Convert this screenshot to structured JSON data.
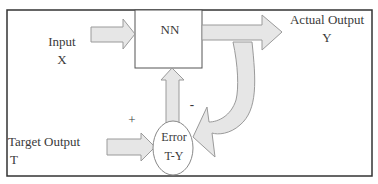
{
  "diagram": {
    "nodes": {
      "nn": {
        "label": "NN"
      },
      "error": {
        "line1": "Error",
        "line2": "T-Y"
      }
    },
    "labels": {
      "input": {
        "line1": "Input",
        "line2": "X"
      },
      "actual_output": {
        "line1": "Actual Output",
        "line2": "Y"
      },
      "target_output": {
        "line1": "Target Output",
        "line2": "T"
      },
      "plus_sign": "+",
      "minus_sign": "-"
    },
    "edges": [
      {
        "from": "input",
        "to": "nn"
      },
      {
        "from": "nn",
        "to": "actual_output"
      },
      {
        "from": "actual_output",
        "to": "error",
        "sign": "-"
      },
      {
        "from": "target_output",
        "to": "error",
        "sign": "+"
      },
      {
        "from": "error",
        "to": "nn"
      }
    ],
    "colors": {
      "arrow_fill": "#e6e6e6",
      "arrow_stroke": "#9a9a9a",
      "frame": "#333333"
    }
  }
}
